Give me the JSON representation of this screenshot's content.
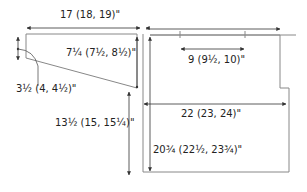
{
  "diagram": {
    "type": "knitting-schematic",
    "pieces": [
      {
        "name": "sleeve-cap-piece"
      },
      {
        "name": "body-piece"
      }
    ],
    "colors": {
      "outline": "#888888",
      "arrow": "#333333",
      "text": "#222222"
    },
    "labels": {
      "sleeve_width": "17 (18, 19)\"",
      "sleeve_cap_height": "7¼ (7½, 8½)\"",
      "sleeve_edge": "3½ (4, 4½)\"",
      "sleeve_length": "13½ (15, 15¼)\"",
      "body_width_top": "20 (21, 22)\"",
      "neck_width": "9 (9½, 10)\"",
      "body_width": "22 (23, 24)\"",
      "body_length": "20¾ (22½, 23¾)\""
    }
  }
}
